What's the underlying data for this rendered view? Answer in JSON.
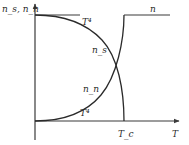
{
  "diagram": {
    "title": "",
    "y_axis_label": "n_s, n_n",
    "x_axis_label": "T",
    "critical_label": "T_c",
    "curve_labels": {
      "ns": "n_s",
      "nn": "n_n",
      "normal_total": "n",
      "ns_approx": "T⁴",
      "nn_approx": "T⁴"
    },
    "colors": {
      "line": "#2a2a2a",
      "axis": "#3a3a3a",
      "background": "#ffffff"
    }
  }
}
